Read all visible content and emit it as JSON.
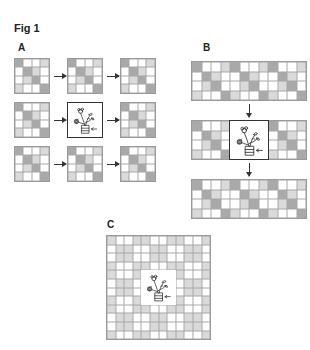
{
  "figure": {
    "title": "Fig 1",
    "panels": [
      {
        "id": "A",
        "label": "A",
        "description": "3x3 arrangement of 4x4 diagonal-pattern tiles; center tile replaced by plant drawing; arrows point left-to-right"
      },
      {
        "id": "B",
        "label": "B",
        "description": "Three 4x12 strips stacked vertically with downward arrows; middle strip has plant drawing replacing center 4x4 block"
      },
      {
        "id": "C",
        "label": "C",
        "description": "12x12 grid with central 4x4 region replaced by plant drawing"
      }
    ]
  },
  "tile_pattern": {
    "rows": 4,
    "cols": 4,
    "cells": [
      [
        "d",
        "w",
        "w",
        "l"
      ],
      [
        "w",
        "d",
        "l",
        "w"
      ],
      [
        "w",
        "l",
        "d",
        "w"
      ],
      [
        "l",
        "w",
        "w",
        "d"
      ]
    ]
  },
  "colors": {
    "dark_cell": "#a9a9a9",
    "light_cell": "#dadada",
    "white_cell": "#ffffff",
    "grid_line": "#9a9a9a",
    "arrow": "#333333"
  },
  "icons": [
    "plant-drawing-icon",
    "arrow-right-icon",
    "arrow-down-icon"
  ]
}
